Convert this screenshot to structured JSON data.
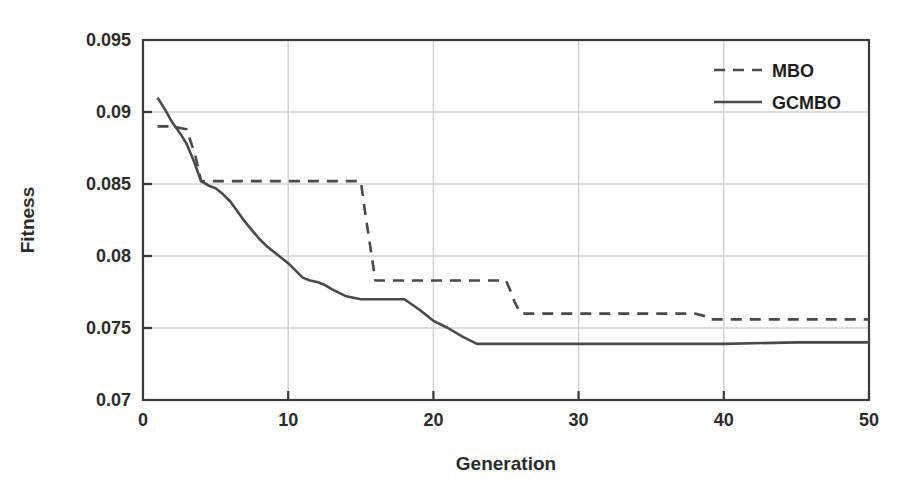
{
  "chart_data": {
    "type": "line",
    "title": "",
    "xlabel": "Generation",
    "ylabel": "Fitness",
    "xlim": [
      0,
      50
    ],
    "ylim": [
      0.07,
      0.095
    ],
    "xticks": [
      0,
      10,
      20,
      30,
      40,
      50
    ],
    "yticks": [
      0.07,
      0.075,
      0.08,
      0.085,
      0.09,
      0.095
    ],
    "xtick_labels": [
      "0",
      "10",
      "20",
      "30",
      "40",
      "50"
    ],
    "ytick_labels": [
      "0.07",
      "0.075",
      "0.08",
      "0.085",
      "0.09",
      "0.095"
    ],
    "grid": true,
    "grid_axis": "y",
    "legend_position": "top-right",
    "line_color": "#4a4a4a",
    "series": [
      {
        "name": "MBO",
        "style": "dashed",
        "x": [
          1,
          2,
          3,
          3.6,
          4,
          5,
          6,
          7,
          8,
          9,
          10,
          11,
          12,
          13,
          14,
          15,
          15.3,
          15.6,
          15.9,
          16,
          17,
          18,
          19,
          20,
          21,
          22,
          23,
          24,
          25,
          25.3,
          25.6,
          25.9,
          26,
          27,
          28,
          29,
          30,
          31,
          32,
          33,
          34,
          35,
          36,
          37,
          38,
          38.8,
          39,
          40,
          42,
          44,
          46,
          48,
          50
        ],
        "y": [
          0.089,
          0.089,
          0.0888,
          0.087,
          0.0852,
          0.0852,
          0.0852,
          0.0852,
          0.0852,
          0.0852,
          0.0852,
          0.0852,
          0.0852,
          0.0852,
          0.0852,
          0.0852,
          0.083,
          0.081,
          0.079,
          0.0783,
          0.0783,
          0.0783,
          0.0783,
          0.0783,
          0.0783,
          0.0783,
          0.0783,
          0.0783,
          0.0783,
          0.0776,
          0.0768,
          0.0762,
          0.076,
          0.076,
          0.076,
          0.076,
          0.076,
          0.076,
          0.076,
          0.076,
          0.076,
          0.076,
          0.076,
          0.076,
          0.076,
          0.0758,
          0.0756,
          0.0756,
          0.0756,
          0.0756,
          0.0756,
          0.0756,
          0.0756
        ]
      },
      {
        "name": "GCMBO",
        "style": "solid",
        "x": [
          1,
          1.5,
          2,
          2.5,
          3,
          3.5,
          4,
          4.5,
          5,
          5.5,
          6,
          6.5,
          7,
          7.5,
          8,
          8.5,
          9,
          9.5,
          10,
          10.5,
          11,
          11.5,
          12,
          12.5,
          13,
          14,
          15,
          16,
          17,
          18,
          19,
          20,
          21,
          22,
          23,
          24,
          26,
          30,
          35,
          40,
          45,
          50
        ],
        "y": [
          0.091,
          0.0902,
          0.0893,
          0.0886,
          0.0878,
          0.0866,
          0.0852,
          0.0849,
          0.0847,
          0.0843,
          0.0838,
          0.0831,
          0.0824,
          0.0818,
          0.0812,
          0.0807,
          0.0803,
          0.0799,
          0.0795,
          0.079,
          0.0785,
          0.0783,
          0.0782,
          0.078,
          0.0777,
          0.0772,
          0.077,
          0.077,
          0.077,
          0.077,
          0.0763,
          0.0755,
          0.075,
          0.0744,
          0.0739,
          0.0739,
          0.0739,
          0.0739,
          0.0739,
          0.0739,
          0.074,
          0.074
        ]
      }
    ],
    "legend": [
      {
        "label": "MBO",
        "style": "dashed"
      },
      {
        "label": "GCMBO",
        "style": "solid"
      }
    ]
  }
}
